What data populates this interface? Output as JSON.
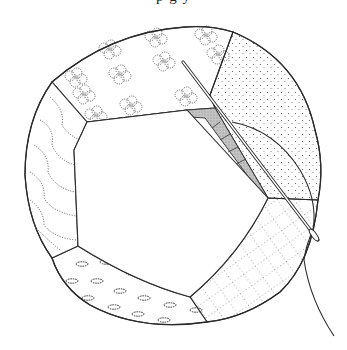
{
  "caption_fragment": {
    "text": "p g y",
    "note_visible": "only descenders of a cropped text line are visible at the top edge"
  },
  "figure": {
    "colors": {
      "ink": "#2a2a2a",
      "background": "#ffffff",
      "seam_shading": "#b8b8b8"
    },
    "panels": [
      {
        "name": "top-panel",
        "pattern": "flower-clusters"
      },
      {
        "name": "top-right-panel",
        "pattern": "stipple-dots"
      },
      {
        "name": "bottom-right-panel",
        "pattern": "dotted-grid"
      },
      {
        "name": "bottom-panel",
        "pattern": "oval-specks"
      },
      {
        "name": "left-panel",
        "pattern": "dotted-wavy-lines"
      }
    ],
    "tools": [
      {
        "name": "needle"
      },
      {
        "name": "thread"
      }
    ]
  }
}
